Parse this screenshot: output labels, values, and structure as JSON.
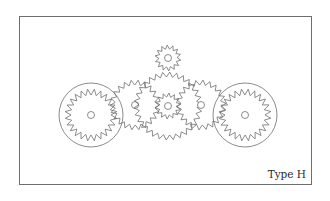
{
  "diagram": {
    "title_label": "Type H",
    "stroke_color": "#6f6f6f",
    "frame_color": "#6e6e6e",
    "background": "#ffffff",
    "gears": [
      {
        "id": "left-ring-gear",
        "cx": 91,
        "cy": 115,
        "ring_r": 32,
        "tip_r": 26,
        "root_r": 20,
        "teeth": 24,
        "hub_r": 3.5,
        "internal": true
      },
      {
        "id": "left-idler-gear",
        "cx": 135,
        "cy": 105,
        "tip_r": 25,
        "root_r": 20,
        "teeth": 22,
        "hub_r": 3.5
      },
      {
        "id": "large-center-gear",
        "cx": 168,
        "cy": 106,
        "tip_r": 34,
        "root_r": 29,
        "teeth": 30,
        "hub_r": 0
      },
      {
        "id": "top-small-gear",
        "cx": 168,
        "cy": 58,
        "tip_r": 13,
        "root_r": 9,
        "teeth": 14,
        "hub_r": 3.5
      },
      {
        "id": "center-sun-gear",
        "cx": 168,
        "cy": 106,
        "tip_r": 13,
        "root_r": 9,
        "teeth": 14,
        "hub_r": 3.5
      },
      {
        "id": "right-idler-gear",
        "cx": 201,
        "cy": 105,
        "tip_r": 25,
        "root_r": 20,
        "teeth": 22,
        "hub_r": 3.5
      },
      {
        "id": "right-ring-gear",
        "cx": 245,
        "cy": 115,
        "ring_r": 32,
        "tip_r": 26,
        "root_r": 20,
        "teeth": 24,
        "hub_r": 3.5,
        "internal": true
      }
    ]
  }
}
